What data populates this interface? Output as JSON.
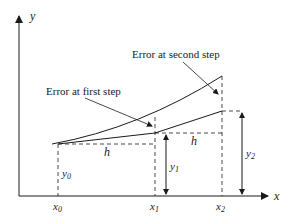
{
  "diagram": {
    "axes": {
      "x_label": "x",
      "y_label": "y"
    },
    "x_ticks": [
      {
        "base": "x",
        "sub": "0"
      },
      {
        "base": "x",
        "sub": "1"
      },
      {
        "base": "x",
        "sub": "2"
      }
    ],
    "heights": [
      {
        "base": "y",
        "sub": "0"
      },
      {
        "base": "y",
        "sub": "1"
      },
      {
        "base": "y",
        "sub": "2"
      }
    ],
    "step_labels": [
      "h",
      "h"
    ],
    "annotations": {
      "first_error": "Error at first step",
      "second_error": "Error at second step"
    },
    "colors": {
      "ink": "#1a1a1a",
      "background": "#ffffff"
    }
  }
}
